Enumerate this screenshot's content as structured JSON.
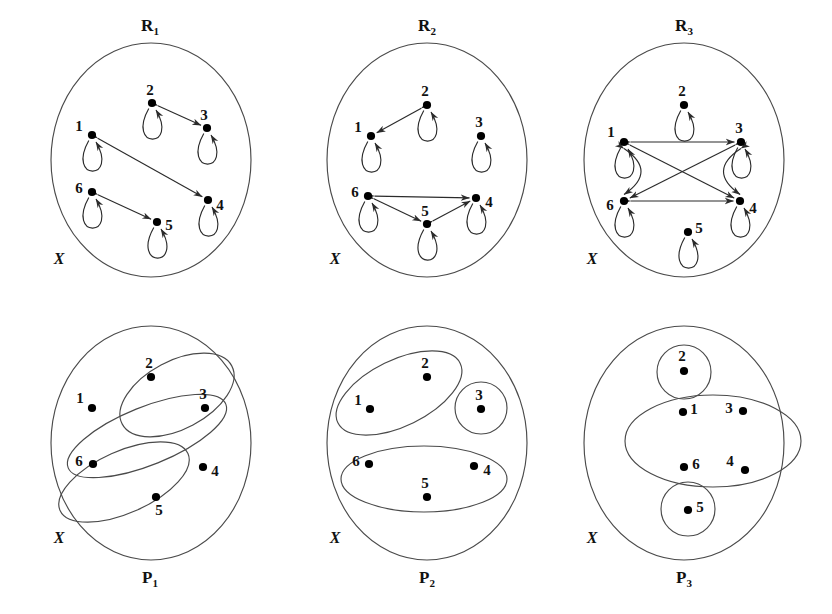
{
  "figure": {
    "universe_label": "X",
    "node_ids": [
      "1",
      "2",
      "3",
      "4",
      "5",
      "6"
    ]
  },
  "chart_data": {
    "type": "diagram",
    "panels": [
      {
        "key": "R1",
        "label": "R",
        "subscript": "1",
        "kind": "relation",
        "universe_label": "X",
        "nodes": [
          {
            "id": "1",
            "x": 92,
            "y": 135,
            "label_dx": -13,
            "label_dy": -7
          },
          {
            "id": "2",
            "x": 152,
            "y": 103,
            "label_dx": -2,
            "label_dy": -11
          },
          {
            "id": "3",
            "x": 207,
            "y": 128,
            "label_dx": -3,
            "label_dy": -11
          },
          {
            "id": "4",
            "x": 208,
            "y": 200,
            "label_dx": 12,
            "label_dy": 7
          },
          {
            "id": "5",
            "x": 157,
            "y": 222,
            "label_dx": 12,
            "label_dy": 5
          },
          {
            "id": "6",
            "x": 92,
            "y": 192,
            "label_dx": -13,
            "label_dy": -2
          }
        ],
        "self_loops": [
          "1",
          "2",
          "3",
          "4",
          "5",
          "6"
        ],
        "edges": [
          {
            "from": "2",
            "to": "3",
            "both": true
          },
          {
            "from": "1",
            "to": "4",
            "both": true
          },
          {
            "from": "6",
            "to": "5",
            "both": true
          }
        ]
      },
      {
        "key": "R2",
        "label": "R",
        "subscript": "2",
        "kind": "relation",
        "universe_label": "X",
        "nodes": [
          {
            "id": "1",
            "x": 371,
            "y": 136,
            "label_dx": -13,
            "label_dy": -7
          },
          {
            "id": "2",
            "x": 427,
            "y": 105,
            "label_dx": -2,
            "label_dy": -12
          },
          {
            "id": "3",
            "x": 481,
            "y": 136,
            "label_dx": -2,
            "label_dy": -12
          },
          {
            "id": "4",
            "x": 476,
            "y": 198,
            "label_dx": 13,
            "label_dy": 6
          },
          {
            "id": "5",
            "x": 427,
            "y": 224,
            "label_dx": -2,
            "label_dy": -11
          },
          {
            "id": "6",
            "x": 368,
            "y": 196,
            "label_dx": -13,
            "label_dy": -2
          }
        ],
        "self_loops": [
          "1",
          "2",
          "3",
          "4",
          "5",
          "6"
        ],
        "edges": [
          {
            "from": "2",
            "to": "1",
            "both": true
          },
          {
            "from": "6",
            "to": "4",
            "both": true
          },
          {
            "from": "6",
            "to": "5",
            "both": true
          },
          {
            "from": "5",
            "to": "4",
            "both": true
          }
        ]
      },
      {
        "key": "R3",
        "label": "R",
        "subscript": "3",
        "kind": "relation",
        "universe_label": "X",
        "nodes": [
          {
            "id": "1",
            "x": 624,
            "y": 142,
            "label_dx": -13,
            "label_dy": -8
          },
          {
            "id": "2",
            "x": 684,
            "y": 105,
            "label_dx": -2,
            "label_dy": -12
          },
          {
            "id": "3",
            "x": 741,
            "y": 142,
            "label_dx": -2,
            "label_dy": -12
          },
          {
            "id": "4",
            "x": 740,
            "y": 201,
            "label_dx": 13,
            "label_dy": 9
          },
          {
            "id": "5",
            "x": 688,
            "y": 232,
            "label_dx": 11,
            "label_dy": -2
          },
          {
            "id": "6",
            "x": 624,
            "y": 201,
            "label_dx": -14,
            "label_dy": 6
          }
        ],
        "self_loops": [
          "1",
          "2",
          "3",
          "4",
          "5",
          "6"
        ],
        "edges": [
          {
            "from": "1",
            "to": "3",
            "both": true
          },
          {
            "from": "6",
            "to": "4",
            "both": true
          },
          {
            "from": "1",
            "to": "4",
            "both": true
          },
          {
            "from": "3",
            "to": "6",
            "both": true
          },
          {
            "from": "1",
            "to": "6",
            "both": true,
            "curve": -34
          },
          {
            "from": "3",
            "to": "4",
            "both": true,
            "curve": 34
          }
        ]
      },
      {
        "key": "P1",
        "label": "P",
        "subscript": "1",
        "kind": "partition",
        "universe_label": "X",
        "nodes": [
          {
            "id": "1",
            "x": 92,
            "y": 408,
            "label_dx": -12,
            "label_dy": -8
          },
          {
            "id": "2",
            "x": 151,
            "y": 377,
            "label_dx": -2,
            "label_dy": -12
          },
          {
            "id": "3",
            "x": 205,
            "y": 408,
            "label_dx": -2,
            "label_dy": -12
          },
          {
            "id": "4",
            "x": 203,
            "y": 467,
            "label_dx": 12,
            "label_dy": 6
          },
          {
            "id": "5",
            "x": 156,
            "y": 497,
            "label_dx": 3,
            "label_dy": 15
          },
          {
            "id": "6",
            "x": 93,
            "y": 464,
            "label_dx": -14,
            "label_dy": -1
          }
        ],
        "blocks": [
          {
            "members": [
              "2",
              "3"
            ],
            "cx": 177,
            "cy": 395,
            "rx": 62,
            "ry": 34,
            "rot": -28
          },
          {
            "members": [
              "1",
              "4"
            ],
            "cx": 147,
            "cy": 436,
            "rx": 85,
            "ry": 29,
            "rot": -22
          },
          {
            "members": [
              "6",
              "5"
            ],
            "cx": 124,
            "cy": 482,
            "rx": 70,
            "ry": 31,
            "rot": -24
          }
        ]
      },
      {
        "key": "P2",
        "label": "P",
        "subscript": "2",
        "kind": "partition",
        "universe_label": "X",
        "nodes": [
          {
            "id": "1",
            "x": 370,
            "y": 409,
            "label_dx": -12,
            "label_dy": -7
          },
          {
            "id": "2",
            "x": 427,
            "y": 377,
            "label_dx": -2,
            "label_dy": -12
          },
          {
            "id": "3",
            "x": 481,
            "y": 409,
            "label_dx": -2,
            "label_dy": -12
          },
          {
            "id": "4",
            "x": 474,
            "y": 466,
            "label_dx": 13,
            "label_dy": 6
          },
          {
            "id": "5",
            "x": 427,
            "y": 497,
            "label_dx": -2,
            "label_dy": -12
          },
          {
            "id": "6",
            "x": 369,
            "y": 464,
            "label_dx": -13,
            "label_dy": -1
          }
        ],
        "blocks": [
          {
            "members": [
              "1",
              "2"
            ],
            "cx": 399,
            "cy": 393,
            "rx": 68,
            "ry": 33,
            "rot": -26
          },
          {
            "members": [
              "3"
            ],
            "cx": 481,
            "cy": 408,
            "rx": 26,
            "ry": 26,
            "rot": 0
          },
          {
            "members": [
              "6",
              "5",
              "4"
            ],
            "cx": 424,
            "cy": 479,
            "rx": 83,
            "ry": 33,
            "rot": 0
          }
        ]
      },
      {
        "key": "P3",
        "label": "P",
        "subscript": "3",
        "kind": "partition",
        "universe_label": "X",
        "nodes": [
          {
            "id": "1",
            "x": 683,
            "y": 412,
            "label_dx": 11,
            "label_dy": -1
          },
          {
            "id": "2",
            "x": 684,
            "y": 371,
            "label_dx": -2,
            "label_dy": -13
          },
          {
            "id": "3",
            "x": 743,
            "y": 411,
            "label_dx": -14,
            "label_dy": -1
          },
          {
            "id": "4",
            "x": 745,
            "y": 470,
            "label_dx": -15,
            "label_dy": -7
          },
          {
            "id": "5",
            "x": 688,
            "y": 510,
            "label_dx": 12,
            "label_dy": -1
          },
          {
            "id": "6",
            "x": 684,
            "y": 467,
            "label_dx": 12,
            "label_dy": -1
          }
        ],
        "blocks": [
          {
            "members": [
              "2"
            ],
            "cx": 684,
            "cy": 372,
            "rx": 27,
            "ry": 27,
            "rot": 0
          },
          {
            "members": [
              "1",
              "3",
              "6",
              "4"
            ],
            "cx": 713,
            "cy": 441,
            "rx": 88,
            "ry": 46,
            "rot": 0
          },
          {
            "members": [
              "5"
            ],
            "cx": 688,
            "cy": 509,
            "rx": 27,
            "ry": 27,
            "rot": 0
          }
        ]
      }
    ],
    "regions": [
      {
        "panel": "R1",
        "cx": 151,
        "cy": 160,
        "rx": 100,
        "ry": 117,
        "label_x": 150,
        "label_y": 31,
        "x_label_x": 59,
        "x_label_y": 264
      },
      {
        "panel": "R2",
        "cx": 427,
        "cy": 160,
        "rx": 100,
        "ry": 117,
        "label_x": 427,
        "label_y": 31,
        "x_label_x": 335,
        "x_label_y": 264
      },
      {
        "panel": "R3",
        "cx": 684,
        "cy": 160,
        "rx": 100,
        "ry": 117,
        "label_x": 684,
        "label_y": 31,
        "x_label_x": 592,
        "x_label_y": 264
      },
      {
        "panel": "P1",
        "cx": 151,
        "cy": 443,
        "rx": 100,
        "ry": 117,
        "label_x": 150,
        "label_y": 583,
        "x_label_x": 59,
        "x_label_y": 543
      },
      {
        "panel": "P2",
        "cx": 427,
        "cy": 443,
        "rx": 100,
        "ry": 117,
        "label_x": 427,
        "label_y": 583,
        "x_label_x": 335,
        "x_label_y": 543
      },
      {
        "panel": "P3",
        "cx": 684,
        "cy": 443,
        "rx": 100,
        "ry": 117,
        "label_x": 684,
        "label_y": 583,
        "x_label_x": 592,
        "x_label_y": 543
      }
    ]
  }
}
